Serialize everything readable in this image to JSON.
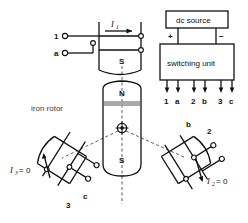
{
  "diagram": {
    "title_text": "brushless dc motor winding and switching diagram",
    "source_block": {
      "label": "dc source",
      "plus": "+",
      "minus": "−"
    },
    "switching_block": {
      "label": "switching unit"
    },
    "switch_terminals": [
      "1",
      "a",
      "2",
      "b",
      "3",
      "c"
    ],
    "rotor": {
      "label": "iron rotor",
      "north_pole": "N",
      "south_pole": "S"
    },
    "stator_top": {
      "pole_label": "S",
      "terminal_top": "1",
      "terminal_bottom": "a",
      "current_symbol": "I",
      "current_sub": "1"
    },
    "coil_right": {
      "terminal_upper": "b",
      "terminal_outer": "2",
      "current_text": "= 0",
      "current_symbol": "I",
      "current_sub": "2"
    },
    "coil_left": {
      "terminal_lower": "3",
      "terminal_outer": "c",
      "current_text": "= 0",
      "current_symbol": "I",
      "current_sub": "3"
    },
    "colors": {
      "ink": "#111111",
      "gray_band": "#9a9a9a",
      "dashed": "#4a4a4a",
      "background": "#ffffff"
    }
  }
}
